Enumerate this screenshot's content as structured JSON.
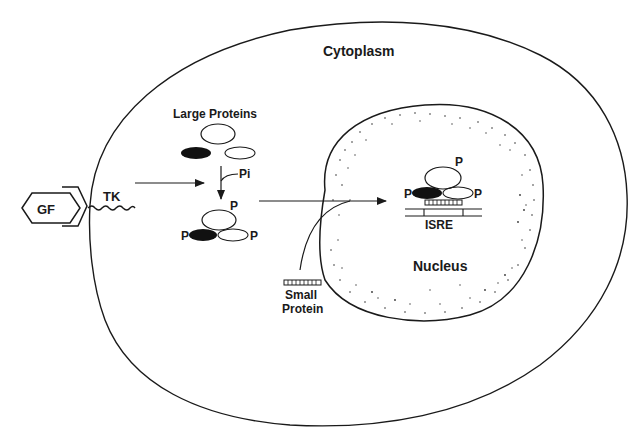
{
  "diagram": {
    "type": "signaling-pathway",
    "colors": {
      "stroke": "#1a1a1a",
      "background": "#ffffff",
      "filled_protein": "#111111"
    },
    "labels": {
      "cytoplasm": "Cytoplasm",
      "nucleus": "Nucleus",
      "growth_factor": "GF",
      "tyrosine_kinase": "TK",
      "large_proteins": "Large Proteins",
      "phosphate_input": "Pi",
      "small_protein_line1": "Small",
      "small_protein_line2": "Protein",
      "isre": "ISRE",
      "phospho_top": "P",
      "phospho_left": "P",
      "phospho_right": "P",
      "nuc_phospho_top": "P",
      "nuc_phospho_left": "P",
      "nuc_phospho_right": "P"
    },
    "nodes": [
      {
        "id": "gf",
        "label": "GF",
        "shape": "hexagon"
      },
      {
        "id": "tk",
        "label": "TK",
        "shape": "wavy-line"
      },
      {
        "id": "large-proteins",
        "label": "Large Proteins",
        "shape": "three-ellipses (open, filled, hatched)"
      },
      {
        "id": "phosphorylated-complex",
        "label": "P / P / P",
        "shape": "three-ellipses phosphorylated"
      },
      {
        "id": "small-protein",
        "label": "Small Protein",
        "shape": "striped-bar"
      },
      {
        "id": "nuclear-complex",
        "label": "ISRE-bound complex",
        "shape": "three-ellipses + bar on DNA"
      },
      {
        "id": "nucleus",
        "label": "Nucleus",
        "shape": "stippled-oval"
      },
      {
        "id": "cytoplasm",
        "label": "Cytoplasm",
        "shape": "cell-outline"
      }
    ],
    "edges": [
      {
        "from": "tk",
        "to": "large-proteins",
        "label": ""
      },
      {
        "from": "large-proteins",
        "to": "phosphorylated-complex",
        "label": "Pi"
      },
      {
        "from": "phosphorylated-complex",
        "to": "nuclear-complex",
        "label": ""
      },
      {
        "from": "small-protein",
        "to": "nuclear-complex",
        "label": ""
      }
    ]
  }
}
